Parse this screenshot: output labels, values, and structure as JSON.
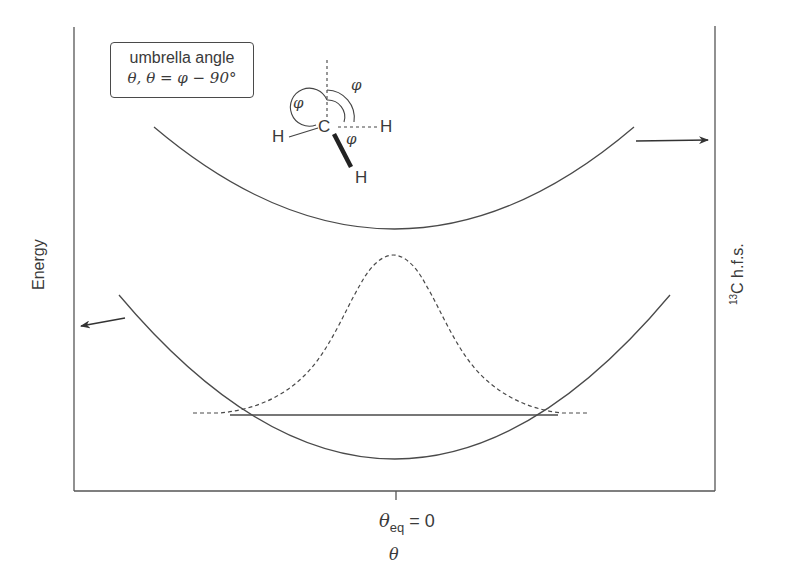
{
  "diagram": {
    "legend": {
      "title": "umbrella angle",
      "formula_theta": "θ,",
      "formula_rhs": "θ = φ − 90°"
    },
    "axes": {
      "left_label": "Energy",
      "right_label_sup": "13",
      "right_label_main": "C h.f.s.",
      "x_tick_symbol": "θ",
      "x_tick_sub": "eq",
      "x_tick_value": " = 0",
      "x_label": "θ"
    },
    "molecule": {
      "center_atom": "C",
      "atoms": [
        "H",
        "H",
        "H"
      ],
      "angle_symbol": "φ"
    },
    "curves": [
      {
        "name": "13C hyperfine splitting vs umbrella angle",
        "style": "solid",
        "shape": "parabola",
        "axis": "right"
      },
      {
        "name": "potential energy vs umbrella angle",
        "style": "solid",
        "shape": "parabola",
        "axis": "left"
      },
      {
        "name": "vibrational ground-state probability distribution",
        "style": "dashed",
        "shape": "gaussian"
      },
      {
        "name": "zero-point energy level",
        "style": "solid",
        "shape": "horizontal line"
      }
    ],
    "colors": {
      "ink": "#3a3a3a",
      "background": "#ffffff"
    }
  }
}
